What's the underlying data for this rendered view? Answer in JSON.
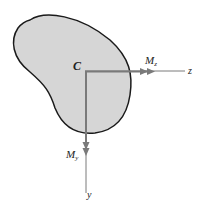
{
  "diagram": {
    "centroid_label": "C",
    "z_axis_label": "z",
    "y_axis_label": "y",
    "moment_z_label": "M",
    "moment_z_sub": "z",
    "moment_y_label": "M",
    "moment_y_sub": "y"
  },
  "colors": {
    "shape_fill": "#d6d6d6",
    "shape_stroke": "#1a1a1a",
    "axis": "#7a7a7a"
  }
}
